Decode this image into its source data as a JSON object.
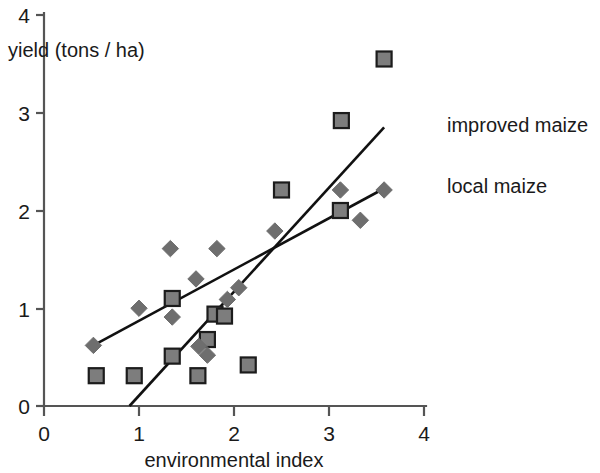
{
  "chart_data": {
    "type": "scatter",
    "title": "",
    "xlabel": "environmental index",
    "ylabel": "yield (tons / ha)",
    "xlim": [
      0,
      4
    ],
    "ylim": [
      0,
      4
    ],
    "xticks": [
      "0",
      "1",
      "2",
      "3",
      "4"
    ],
    "yticks": [
      "0",
      "1",
      "2",
      "3",
      "4"
    ],
    "grid": false,
    "legend_position": "right-inline",
    "series": [
      {
        "name": "improved maize",
        "marker": "square",
        "color": "#7d7d7d",
        "points": [
          [
            0.55,
            0.31
          ],
          [
            0.95,
            0.31
          ],
          [
            1.35,
            1.1
          ],
          [
            1.35,
            0.51
          ],
          [
            1.62,
            0.31
          ],
          [
            1.72,
            0.68
          ],
          [
            1.8,
            0.94
          ],
          [
            1.9,
            0.92
          ],
          [
            2.15,
            0.42
          ],
          [
            2.5,
            2.21
          ],
          [
            3.12,
            2.0
          ],
          [
            3.13,
            2.92
          ],
          [
            3.58,
            3.55
          ]
        ]
      },
      {
        "name": "local maize",
        "marker": "diamond",
        "color": "#6e6e6e",
        "points": [
          [
            0.52,
            0.62
          ],
          [
            1.0,
            1.0
          ],
          [
            1.33,
            1.61
          ],
          [
            1.35,
            0.91
          ],
          [
            1.6,
            1.3
          ],
          [
            1.63,
            0.61
          ],
          [
            1.72,
            0.52
          ],
          [
            1.82,
            1.61
          ],
          [
            1.93,
            1.09
          ],
          [
            2.05,
            1.21
          ],
          [
            2.43,
            1.79
          ],
          [
            3.12,
            2.21
          ],
          [
            3.33,
            1.9
          ],
          [
            3.58,
            2.21
          ]
        ]
      }
    ],
    "trend_lines": [
      {
        "name": "improved maize",
        "x_start": 0.9,
        "y_start": 0.0,
        "x_end": 3.58,
        "y_end": 2.85
      },
      {
        "name": "local maize",
        "x_start": 0.52,
        "y_start": 0.62,
        "x_end": 3.57,
        "y_end": 2.22
      }
    ],
    "annotations": [
      {
        "text": "improved maize",
        "x": 3.65,
        "y": 2.85
      },
      {
        "text": "local maize",
        "x": 3.65,
        "y": 2.22
      }
    ]
  },
  "legend": {
    "improved_label": "improved maize",
    "local_label": "local maize"
  },
  "axes": {
    "x_title": "environmental index",
    "y_title": "yield (tons / ha)",
    "x_tick_0": "0",
    "x_tick_1": "1",
    "x_tick_2": "2",
    "x_tick_3": "3",
    "x_tick_4": "4",
    "y_tick_0": "0",
    "y_tick_1": "1",
    "y_tick_2": "2",
    "y_tick_3": "3",
    "y_tick_4": "4"
  }
}
